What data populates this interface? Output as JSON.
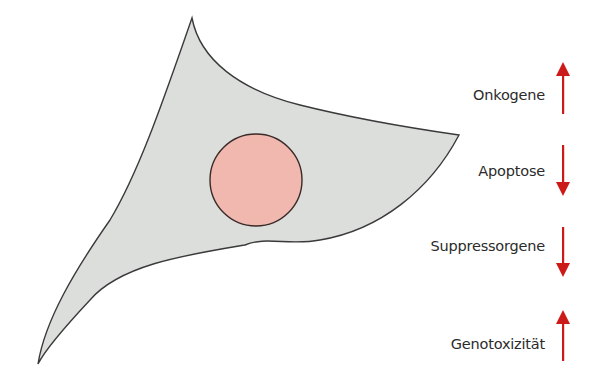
{
  "diagram": {
    "cell": {
      "fill": "#dcdedb",
      "stroke": "#3a3a3a",
      "nucleus": {
        "fill": "#f0b8ae",
        "stroke": "#3a2a28",
        "cx": 256,
        "cy": 180,
        "r": 46
      }
    },
    "arrow_color": "#cc1a18",
    "items": [
      {
        "label": "Onkogene",
        "direction": "up"
      },
      {
        "label": "Apoptose",
        "direction": "down"
      },
      {
        "label": "Suppressorgene",
        "direction": "down"
      },
      {
        "label": "Genotoxizität",
        "direction": "up"
      }
    ]
  }
}
